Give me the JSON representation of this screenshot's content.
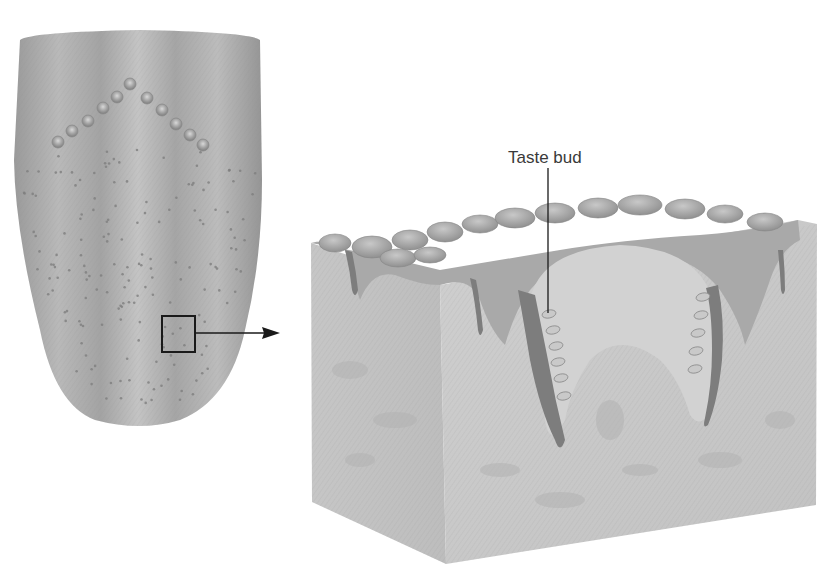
{
  "figure": {
    "labels": [
      {
        "id": "taste-bud",
        "text": "Taste bud"
      }
    ],
    "panels": [
      {
        "id": "tongue",
        "description": "Dorsal view of the tongue with a square marking the magnified region"
      },
      {
        "id": "tissue-block",
        "description": "3D cutaway block of papillae showing taste buds along the trench walls"
      }
    ],
    "colors": {
      "background": "#ffffff",
      "tongue_light": "#c9c9c9",
      "tongue_dark": "#8a8a8a",
      "tissue_light": "#d4d4d4",
      "tissue_mid": "#b5b5b5",
      "tissue_dark": "#8f8f8f",
      "trench": "#7d7d7d",
      "line": "#1a1a1a"
    }
  }
}
